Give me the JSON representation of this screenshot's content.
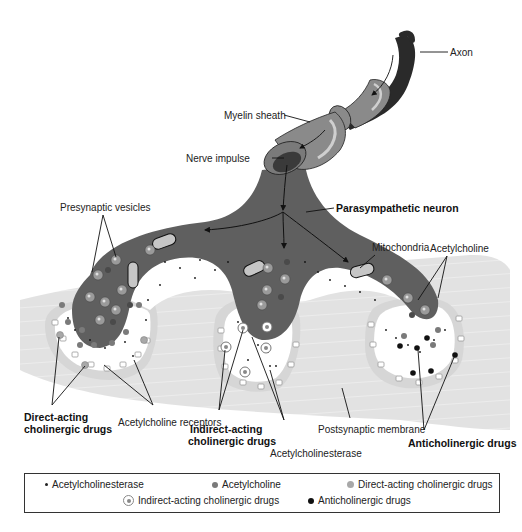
{
  "diagram": {
    "labels": {
      "axon": "Axon",
      "myelin_sheath": "Myelin sheath",
      "nerve_impulse": "Nerve impulse",
      "parasympathetic_neuron": "Parasympathetic neuron",
      "presynaptic_vesicles": "Presynaptic vesicles",
      "mitochondria": "Mitochondria",
      "acetylcholine": "Acetylcholine",
      "direct_acting_1": "Direct-acting",
      "direct_acting_2": "cholinergic drugs",
      "acetylcholine_receptors": "Acetylcholine receptors",
      "indirect_acting_1": "Indirect-acting",
      "indirect_acting_2": "cholinergic drugs",
      "acetylcholinesterase": "Acetylcholinesterase",
      "postsynaptic_membrane": "Postsynaptic membrane",
      "anticholinergic_drugs": "Anticholinergic drugs"
    },
    "colors": {
      "neuron_fill": "#5f5f5f",
      "axon_fill": "#2a2a2a",
      "myelin_fill": "#8a8a8a",
      "myelin_highlight": "#c8c8c8",
      "muscle_fill": "#e2e2e2",
      "muscle_stripe": "#f4f4f4",
      "cleft_fill": "#ffffff",
      "receptor_band": "#d4d4d4",
      "vesicle_fill": "#9a9a9a",
      "acetylcholine": "#7a7a7a",
      "direct_acting": "#a8a8a8",
      "anticholinergic": "#111111"
    }
  },
  "legend": {
    "items": [
      {
        "symbol": "small-dot",
        "label": "Acetylcholinesterase"
      },
      {
        "symbol": "dark-gray-dot",
        "label": "Acetylcholine"
      },
      {
        "symbol": "light-gray-dot",
        "label": "Direct-acting cholinergic drugs"
      },
      {
        "symbol": "ringed-dot",
        "label": "Indirect-acting cholinergic drugs"
      },
      {
        "symbol": "black-dot",
        "label": "Anticholinergic drugs"
      }
    ]
  }
}
